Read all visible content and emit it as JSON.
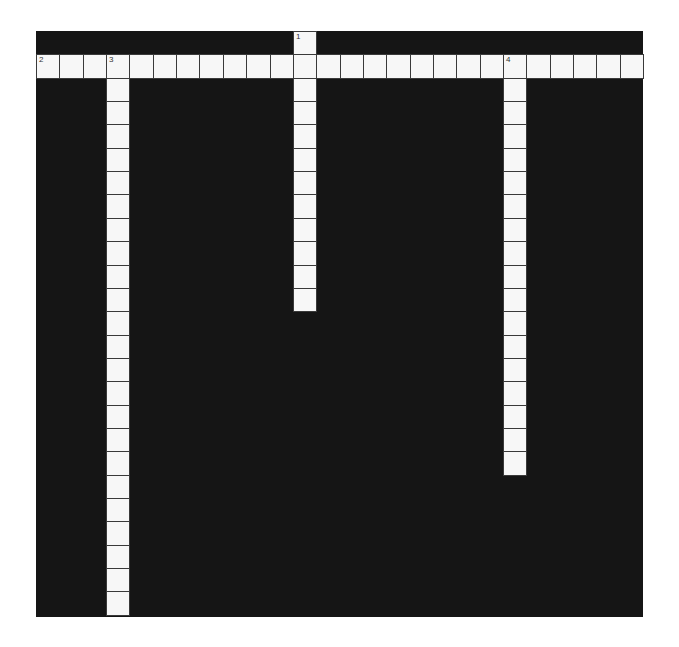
{
  "puzzle": {
    "cols": 26,
    "rows": 25,
    "cell_size": 23.35,
    "colors": {
      "block": "#151515",
      "cell": "#f7f7f7",
      "border": "#3a3a3a"
    },
    "words": [
      {
        "number": "1",
        "direction": "down",
        "row": 0,
        "col": 11,
        "length": 12
      },
      {
        "number": "2",
        "direction": "across",
        "row": 1,
        "col": 0,
        "length": 26
      },
      {
        "number": "3",
        "direction": "down",
        "row": 1,
        "col": 3,
        "length": 24
      },
      {
        "number": "4",
        "direction": "down",
        "row": 1,
        "col": 20,
        "length": 18
      }
    ]
  }
}
